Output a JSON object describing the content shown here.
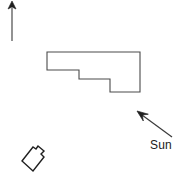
{
  "diagram": {
    "type": "site-plan-sketch",
    "background_color": "#ffffff",
    "stroke_color": "#3a3a3a",
    "ink_color": "#1a1a1a"
  },
  "north_arrow": {
    "name": "north-arrow",
    "direction": "up",
    "label": "",
    "shaft": {
      "x1": 12,
      "y1": 8,
      "x2": 12,
      "y2": 41
    },
    "head": {
      "tip_x": 12,
      "tip_y": 1,
      "half_width": 4,
      "height": 8
    },
    "stroke_width": 1.1
  },
  "building_outline": {
    "name": "main-building-footprint",
    "description": "L-shaped / stepped building footprint",
    "stroke_width": 1.1,
    "fill": "none",
    "points": [
      [
        47,
        52
      ],
      [
        140,
        52
      ],
      [
        140,
        92
      ],
      [
        110,
        92
      ],
      [
        110,
        79
      ],
      [
        79,
        79
      ],
      [
        79,
        70
      ],
      [
        47,
        70
      ]
    ]
  },
  "small_structure": {
    "name": "small-outbuilding-footprint",
    "description": "Small rotated rectangular outbuilding with a projecting tab",
    "stroke_width": 1.4,
    "fill": "none",
    "points": [
      [
        22,
        161
      ],
      [
        33,
        147
      ],
      [
        36,
        149
      ],
      [
        38,
        146
      ],
      [
        44,
        151
      ],
      [
        41,
        154
      ],
      [
        44,
        157
      ],
      [
        33,
        171
      ]
    ]
  },
  "sun_indicator": {
    "name": "sun-direction-arrow",
    "label": "Sun",
    "direction": "up-left",
    "shaft": {
      "x1": 172,
      "y1": 137,
      "x2": 141,
      "y2": 114
    },
    "head": {
      "tip_x": 137,
      "tip_y": 111
    },
    "stroke_width": 1.2,
    "label_position": {
      "x": 150,
      "y": 139
    },
    "label_font_size": "12px"
  }
}
